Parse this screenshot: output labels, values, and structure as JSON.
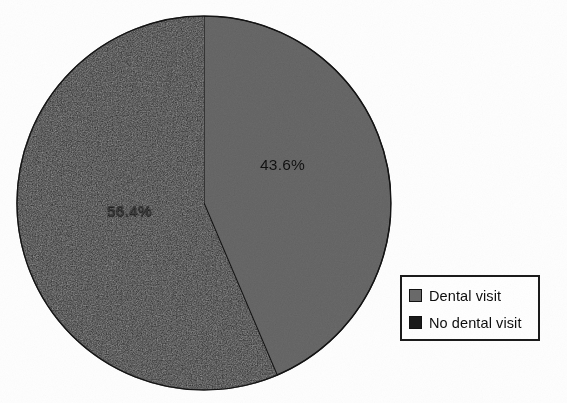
{
  "chart_data": {
    "type": "pie",
    "title": "",
    "categories": [
      "Dental visit",
      "No dental visit"
    ],
    "values": [
      43.6,
      56.4
    ],
    "labels": [
      "43.6%",
      "56.4%"
    ],
    "units": "percent",
    "start_angle_deg": 0,
    "direction": "clockwise",
    "legend_position": "right",
    "grid": false,
    "colors": [
      "#6a6a6a",
      "#1a1a1a"
    ],
    "series": [
      {
        "name": "Share of population",
        "slices": [
          {
            "label": "Dental visit",
            "value": 43.6,
            "display": "43.6%",
            "color": "#6a6a6a",
            "sweep_deg": 156.96
          },
          {
            "label": "No dental visit",
            "value": 56.4,
            "display": "56.4%",
            "color": "#1a1a1a",
            "sweep_deg": 203.04
          }
        ]
      }
    ]
  },
  "slice_labels": {
    "gray": "43.6%",
    "dark": "56.4%"
  },
  "legend": {
    "items": [
      {
        "label": "Dental visit",
        "color": "#6a6a6a"
      },
      {
        "label": "No dental visit",
        "color": "#1a1a1a"
      }
    ]
  },
  "colors": {
    "slice_light": "#6a6a6a",
    "slice_dark": "#1a1a1a",
    "outline": "#141414",
    "legend_border": "#1b1b1b",
    "background": "#fefefe"
  }
}
